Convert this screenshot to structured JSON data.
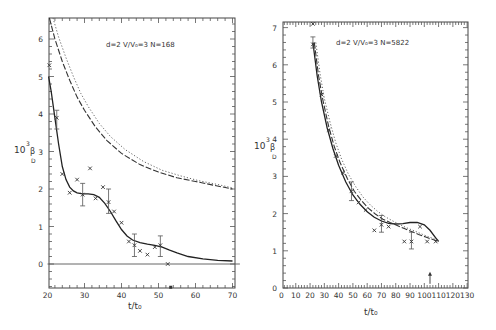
{
  "chart_data": [
    {
      "type": "scatter",
      "panel": "left",
      "title": "",
      "annotation": "d=2  V/V₀=3  N=168",
      "xlabel": "t/t₀",
      "ylabel": "10³β_D",
      "xlim": [
        20,
        72
      ],
      "ylim": [
        -0.65,
        6.6
      ],
      "xticks": [
        20,
        30,
        40,
        50,
        60,
        70
      ],
      "yticks": [
        0,
        1,
        2,
        3,
        4,
        5,
        6
      ],
      "grid": false,
      "series": [
        {
          "name": "data (x markers)",
          "style": "markers",
          "points": [
            [
              20.5,
              5.3
            ],
            [
              22.5,
              3.9
            ],
            [
              24,
              2.4
            ],
            [
              26,
              1.9
            ],
            [
              28,
              2.25
            ],
            [
              29.5,
              1.85
            ],
            [
              31.5,
              2.55
            ],
            [
              33,
              1.75
            ],
            [
              35,
              2.05
            ],
            [
              36.5,
              1.65
            ],
            [
              38,
              1.4
            ],
            [
              40,
              1.1
            ],
            [
              42,
              0.6
            ],
            [
              43.5,
              0.5
            ],
            [
              45,
              0.35
            ],
            [
              47,
              0.25
            ],
            [
              49,
              0.45
            ],
            [
              50.5,
              0.5
            ],
            [
              52.5,
              0.0
            ]
          ],
          "error_bars": [
            {
              "x": 22.5,
              "y": 3.9,
              "lo": 3.6,
              "hi": 4.1
            },
            {
              "x": 29.5,
              "y": 1.85,
              "lo": 1.55,
              "hi": 2.15
            },
            {
              "x": 36.5,
              "y": 1.65,
              "lo": 1.35,
              "hi": 2.0
            },
            {
              "x": 43.5,
              "y": 0.5,
              "lo": 0.2,
              "hi": 0.8
            },
            {
              "x": 50.5,
              "y": 0.5,
              "lo": 0.2,
              "hi": 0.75
            }
          ]
        },
        {
          "name": "fit (solid)",
          "style": "solid",
          "points": [
            [
              20.3,
              5.0
            ],
            [
              21,
              4.6
            ],
            [
              22,
              3.9
            ],
            [
              23,
              3.2
            ],
            [
              24,
              2.6
            ],
            [
              25,
              2.25
            ],
            [
              26,
              2.05
            ],
            [
              27,
              1.95
            ],
            [
              28,
              1.9
            ],
            [
              29.5,
              1.87
            ],
            [
              31,
              1.87
            ],
            [
              32.5,
              1.85
            ],
            [
              34,
              1.78
            ],
            [
              35.5,
              1.62
            ],
            [
              37,
              1.4
            ],
            [
              38.5,
              1.15
            ],
            [
              40,
              0.92
            ],
            [
              41.5,
              0.75
            ],
            [
              43,
              0.64
            ],
            [
              45,
              0.57
            ],
            [
              47,
              0.53
            ],
            [
              49,
              0.5
            ],
            [
              51,
              0.45
            ],
            [
              53,
              0.37
            ],
            [
              55,
              0.3
            ],
            [
              58,
              0.2
            ],
            [
              62,
              0.14
            ],
            [
              66,
              0.1
            ],
            [
              70,
              0.08
            ]
          ]
        },
        {
          "name": "theory (dashed)",
          "style": "dashed",
          "points": [
            [
              20.5,
              6.6
            ],
            [
              22,
              6.0
            ],
            [
              24,
              5.4
            ],
            [
              26,
              4.9
            ],
            [
              28,
              4.45
            ],
            [
              30,
              4.1
            ],
            [
              33,
              3.65
            ],
            [
              36,
              3.3
            ],
            [
              40,
              2.95
            ],
            [
              45,
              2.65
            ],
            [
              50,
              2.45
            ],
            [
              55,
              2.3
            ],
            [
              60,
              2.2
            ],
            [
              65,
              2.1
            ],
            [
              70,
              2.0
            ]
          ]
        },
        {
          "name": "theory (dotted)",
          "style": "dotted",
          "points": [
            [
              21.5,
              6.6
            ],
            [
              23,
              6.05
            ],
            [
              25,
              5.5
            ],
            [
              27,
              5.0
            ],
            [
              29,
              4.55
            ],
            [
              31,
              4.2
            ],
            [
              34,
              3.75
            ],
            [
              37,
              3.4
            ],
            [
              41,
              3.05
            ],
            [
              46,
              2.73
            ],
            [
              51,
              2.5
            ],
            [
              56,
              2.35
            ],
            [
              61,
              2.22
            ],
            [
              66,
              2.12
            ],
            [
              70,
              2.03
            ]
          ]
        },
        {
          "name": "zero line",
          "style": "thin",
          "points": [
            [
              20,
              0.0
            ],
            [
              72,
              0.0
            ]
          ]
        }
      ],
      "extra_markers": [
        {
          "x": 53.3,
          "y": -0.62,
          "desc": "marker on x-axis"
        }
      ]
    },
    {
      "type": "scatter",
      "panel": "right",
      "title": "",
      "annotation": "d=2  V/V₀=3  N=5822",
      "xlabel": "t/t₀",
      "ylabel": "10³β_D",
      "xlim": [
        0,
        130
      ],
      "ylim": [
        0,
        7.15
      ],
      "xticks": [
        0,
        10,
        20,
        30,
        40,
        50,
        60,
        70,
        80,
        90,
        100,
        110,
        120,
        130
      ],
      "yticks": [
        0,
        1,
        2,
        3,
        4,
        5,
        6,
        7
      ],
      "grid": false,
      "series": [
        {
          "name": "data (x markers)",
          "style": "markers",
          "points": [
            [
              22,
              7.1
            ],
            [
              22,
              6.55
            ],
            [
              28,
              5.2
            ],
            [
              33,
              4.25
            ],
            [
              38,
              3.55
            ],
            [
              43,
              3.1
            ],
            [
              49,
              2.6
            ],
            [
              54,
              2.3
            ],
            [
              59,
              2.1
            ],
            [
              65,
              1.55
            ],
            [
              70,
              1.7
            ],
            [
              75,
              1.65
            ],
            [
              86,
              1.25
            ],
            [
              91,
              1.25
            ],
            [
              97,
              1.65
            ],
            [
              102,
              1.25
            ],
            [
              108,
              1.25
            ]
          ],
          "error_bars": [
            {
              "x": 22,
              "y": 6.55,
              "lo": 6.45,
              "hi": 6.75
            },
            {
              "x": 49,
              "y": 2.6,
              "lo": 2.35,
              "hi": 2.85
            },
            {
              "x": 70,
              "y": 1.7,
              "lo": 1.5,
              "hi": 1.95
            },
            {
              "x": 91,
              "y": 1.25,
              "lo": 1.05,
              "hi": 1.5
            }
          ]
        },
        {
          "name": "fit (solid)",
          "style": "solid",
          "points": [
            [
              22,
              6.6
            ],
            [
              25,
              5.7
            ],
            [
              28,
              5.0
            ],
            [
              32,
              4.3
            ],
            [
              36,
              3.75
            ],
            [
              40,
              3.3
            ],
            [
              45,
              2.85
            ],
            [
              50,
              2.5
            ],
            [
              55,
              2.25
            ],
            [
              60,
              2.05
            ],
            [
              65,
              1.9
            ],
            [
              70,
              1.8
            ],
            [
              75,
              1.74
            ],
            [
              80,
              1.72
            ],
            [
              85,
              1.73
            ],
            [
              90,
              1.76
            ],
            [
              95,
              1.76
            ],
            [
              100,
              1.7
            ],
            [
              104,
              1.55
            ],
            [
              108,
              1.35
            ],
            [
              110,
              1.25
            ]
          ]
        },
        {
          "name": "theory (dashed)",
          "style": "dashed",
          "points": [
            [
              23,
              6.6
            ],
            [
              26,
              5.7
            ],
            [
              29,
              5.05
            ],
            [
              33,
              4.35
            ],
            [
              37,
              3.8
            ],
            [
              41,
              3.38
            ],
            [
              46,
              2.95
            ],
            [
              51,
              2.6
            ],
            [
              56,
              2.35
            ],
            [
              61,
              2.14
            ],
            [
              66,
              1.98
            ],
            [
              71,
              1.85
            ],
            [
              76,
              1.76
            ],
            [
              81,
              1.68
            ],
            [
              86,
              1.6
            ],
            [
              91,
              1.52
            ],
            [
              96,
              1.44
            ],
            [
              101,
              1.37
            ],
            [
              106,
              1.3
            ],
            [
              110,
              1.25
            ]
          ]
        },
        {
          "name": "theory (dotted)",
          "style": "dotted",
          "points": [
            [
              24,
              6.6
            ],
            [
              27,
              5.75
            ],
            [
              30,
              5.1
            ],
            [
              34,
              4.45
            ],
            [
              38,
              3.9
            ],
            [
              42,
              3.47
            ],
            [
              47,
              3.05
            ],
            [
              52,
              2.72
            ],
            [
              57,
              2.45
            ],
            [
              62,
              2.24
            ],
            [
              67,
              2.07
            ],
            [
              72,
              1.93
            ],
            [
              77,
              1.82
            ],
            [
              82,
              1.72
            ],
            [
              87,
              1.63
            ],
            [
              92,
              1.55
            ],
            [
              97,
              1.47
            ],
            [
              102,
              1.39
            ],
            [
              107,
              1.32
            ],
            [
              110,
              1.27
            ]
          ]
        }
      ],
      "extra_markers": [
        {
          "x": 104,
          "y": 0.22,
          "desc": "upward arrow marker"
        }
      ]
    }
  ],
  "panels": {
    "left": {
      "box": {
        "x0": 49,
        "y0": 18,
        "x1": 235,
        "y1": 288
      },
      "px": {
        "x_at_20": 47.5,
        "x_per_unit": 3.7,
        "y_at_0": 264,
        "y_per_unit": 37.5
      }
    },
    "right": {
      "box": {
        "x0": 283,
        "y0": 22,
        "x1": 468,
        "y1": 288
      },
      "px": {
        "x_at_0": 281.5,
        "x_per_unit": 1.428,
        "y_at_0": 288,
        "y_per_unit": 37.2
      }
    }
  },
  "labels": {
    "left_ylabel_main": "10",
    "left_ylabel_sup": "3",
    "left_ylabel_beta": "β",
    "left_ylabel_sub": "D",
    "right_ylabel_main": "10",
    "right_ylabel_sup": "3",
    "right_ylabel_beta": "β",
    "right_ylabel_sub": "D",
    "left_xlabel": "t/t₀",
    "right_xlabel": "t/t₀",
    "left_annotation": "d=2  V/V₀=3  N=168",
    "right_annotation": "d=2  V/V₀=3  N=5822"
  }
}
